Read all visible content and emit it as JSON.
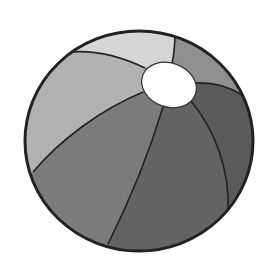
{
  "image": {
    "subject": "beach ball",
    "style": "grayscale illustration",
    "width": 273,
    "height": 267
  },
  "ball": {
    "center": [
      139,
      141
    ],
    "rx": 114,
    "ry": 110,
    "outline_color": "#222222",
    "outline_width": 3,
    "hole": {
      "center": [
        169,
        85
      ],
      "rx": 28,
      "ry": 22,
      "rotation_deg": 20,
      "color": "#ffffff"
    },
    "panels": [
      {
        "name": "top-panel",
        "color": "#d6d6d6"
      },
      {
        "name": "left-panel",
        "color": "#b2b2b2"
      },
      {
        "name": "top-right-panel",
        "color": "#8f8f8f"
      },
      {
        "name": "lower-left-panel",
        "color": "#7b7b7b"
      },
      {
        "name": "bottom-center-panel",
        "color": "#636363"
      },
      {
        "name": "right-panel",
        "color": "#5a5a5a"
      },
      {
        "name": "far-right-panel",
        "color": "#606060"
      }
    ]
  }
}
